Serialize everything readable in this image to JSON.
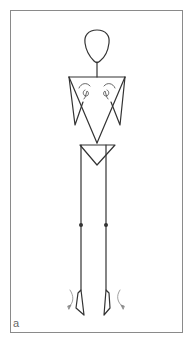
{
  "figure": {
    "panel_label": "a",
    "colors": {
      "stroke": "#333333",
      "frame": "#8a8a8a",
      "arrow": "#777777",
      "background": "#ffffff"
    }
  }
}
